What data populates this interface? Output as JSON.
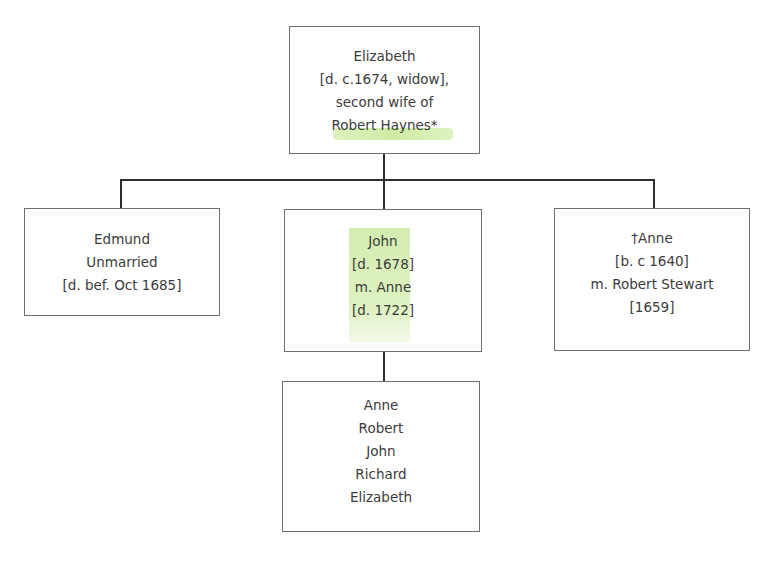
{
  "diagram": {
    "type": "family-tree",
    "root": {
      "lines": [
        "Elizabeth",
        "[d. c.1674, widow],",
        "second wife of",
        "Robert Haynes*"
      ],
      "highlighted_text": "Robert Haynes"
    },
    "children": [
      {
        "lines": [
          "Edmund",
          "Unmarried",
          "[d. bef. Oct 1685]"
        ]
      },
      {
        "lines": [
          "John",
          "[d. 1678]",
          "m. Anne",
          "[d. 1722]"
        ],
        "highlighted": true
      },
      {
        "lines": [
          "†Anne",
          "[b. c 1640]",
          "m. Robert Stewart",
          "[1659]"
        ]
      }
    ],
    "grandchildren": {
      "parent": "John",
      "lines": [
        "Anne",
        "Robert",
        "John",
        "Richard",
        "Elizabeth"
      ]
    },
    "colors": {
      "box_border": "#6e6e6e",
      "connector": "#2e2e2e",
      "text": "#3b3b3b",
      "highlight": "#d3ecb0"
    }
  }
}
